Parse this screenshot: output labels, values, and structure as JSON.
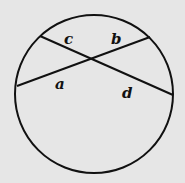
{
  "diagram": {
    "type": "intersecting chords in circle",
    "circle": {
      "cx": 94,
      "cy": 94,
      "r": 79
    },
    "chords": [
      {
        "name": "chord-1",
        "x1": 40,
        "y1": 36,
        "x2": 173,
        "y2": 95
      },
      {
        "name": "chord-2",
        "x1": 17,
        "y1": 86,
        "x2": 150,
        "y2": 37
      }
    ],
    "labels": {
      "a": "a",
      "b": "b",
      "c": "c",
      "d": "d"
    },
    "colors": {
      "background": "#e6e6e6",
      "stroke": "#111111"
    }
  }
}
